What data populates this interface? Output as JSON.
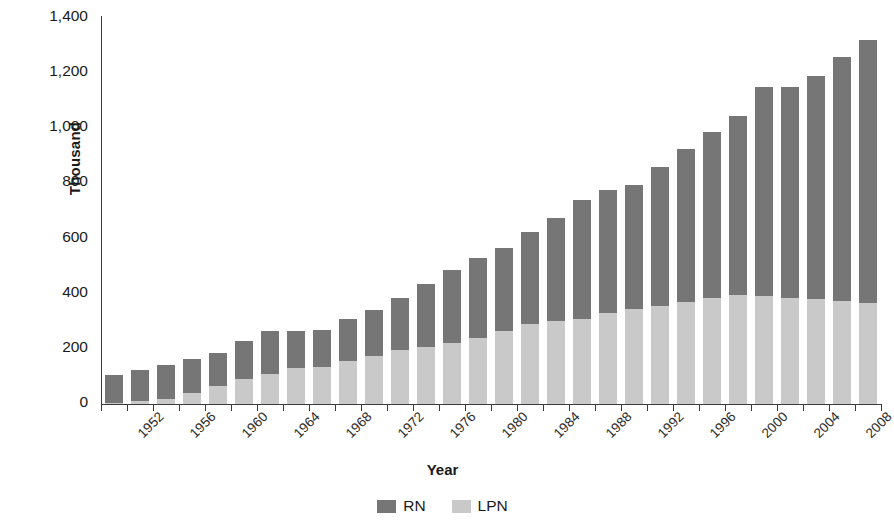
{
  "chart_data": {
    "type": "bar",
    "stacked": true,
    "title": "",
    "xlabel": "Year",
    "ylabel": "Thousand",
    "ylim": [
      0,
      1400
    ],
    "ytick_step": 200,
    "ytick_labels": [
      "0",
      "200",
      "400",
      "600",
      "800",
      "1,000",
      "1,200",
      "1,400"
    ],
    "grid": false,
    "legend_position": "bottom-center",
    "colors": {
      "RN": "#767676",
      "LPN": "#c9c9c9"
    },
    "categories": [
      "1952",
      "1954",
      "1956",
      "1958",
      "1960",
      "1962",
      "1964",
      "1966",
      "1968",
      "1970",
      "1972",
      "1974",
      "1976",
      "1978",
      "1980",
      "1982",
      "1984",
      "1986",
      "1988",
      "1990",
      "1992",
      "1994",
      "1996",
      "1998",
      "2000",
      "2002",
      "2004",
      "2006",
      "2008",
      "2010"
    ],
    "tick_labels_shown": [
      "1952",
      "1956",
      "1960",
      "1964",
      "1968",
      "1972",
      "1976",
      "1980",
      "1984",
      "1988",
      "1992",
      "1996",
      "2000",
      "2004",
      "2008"
    ],
    "series": [
      {
        "name": "LPN",
        "values": [
          5,
          10,
          20,
          40,
          65,
          90,
          110,
          130,
          135,
          155,
          175,
          195,
          205,
          220,
          240,
          265,
          290,
          300,
          310,
          330,
          345,
          355,
          370,
          385,
          395,
          390,
          385,
          380,
          375,
          365
        ]
      },
      {
        "name": "RN",
        "values": [
          100,
          115,
          120,
          125,
          120,
          140,
          155,
          135,
          135,
          155,
          165,
          190,
          230,
          265,
          290,
          300,
          335,
          375,
          430,
          445,
          450,
          505,
          555,
          600,
          650,
          760,
          765,
          810,
          885,
          955
        ]
      }
    ],
    "totals": [
      105,
      125,
      140,
      165,
      185,
      205,
      230,
      265,
      240,
      270,
      310,
      340,
      390,
      435,
      490,
      540,
      590,
      640,
      695,
      745,
      795,
      860,
      930,
      985,
      1045,
      1095,
      1150,
      1190,
      1260,
      1320
    ]
  },
  "legend": {
    "entries": [
      {
        "label": "RN",
        "color": "#767676"
      },
      {
        "label": "LPN",
        "color": "#c9c9c9"
      }
    ]
  }
}
